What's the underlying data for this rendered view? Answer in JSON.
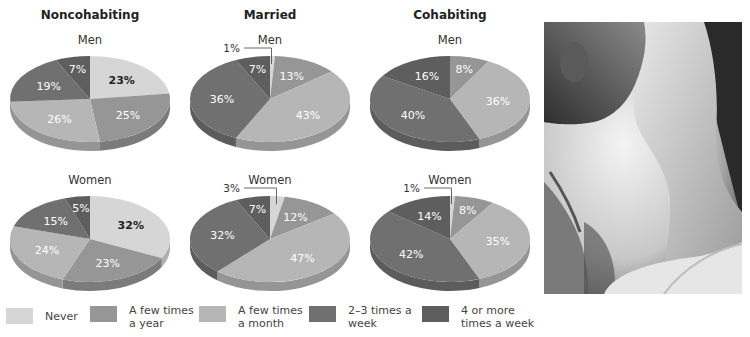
{
  "chart_data": {
    "type": "pie",
    "categories": [
      "Never",
      "A few times a year",
      "A few times a month",
      "2–3 times a week",
      "4 or more times a week"
    ],
    "colors": [
      "#d6d6d6",
      "#969696",
      "#b6b6b6",
      "#707070",
      "#5e5e5e"
    ],
    "groups": [
      {
        "title": "Noncohabiting",
        "charts": [
          {
            "subtitle": "Men",
            "values": [
              23,
              25,
              26,
              19,
              7
            ],
            "labels": [
              "23%",
              "25%",
              "26%",
              "19%",
              "7%"
            ]
          },
          {
            "subtitle": "Women",
            "values": [
              32,
              23,
              24,
              15,
              5
            ],
            "labels": [
              "32%",
              "23%",
              "24%",
              "15%",
              "5%"
            ]
          }
        ]
      },
      {
        "title": "Married",
        "charts": [
          {
            "subtitle": "Men",
            "values": [
              1,
              13,
              43,
              36,
              7
            ],
            "labels": [
              "1%",
              "13%",
              "43%",
              "36%",
              "7%"
            ]
          },
          {
            "subtitle": "Women",
            "values": [
              3,
              12,
              47,
              32,
              7
            ],
            "labels": [
              "3%",
              "12%",
              "47%",
              "32%",
              "7%"
            ]
          }
        ]
      },
      {
        "title": "Cohabiting",
        "charts": [
          {
            "subtitle": "Men",
            "values": [
              0,
              8,
              36,
              40,
              16
            ],
            "labels": [
              "",
              "8%",
              "36%",
              "40%",
              "16%"
            ]
          },
          {
            "subtitle": "Women",
            "values": [
              1,
              8,
              35,
              42,
              14
            ],
            "labels": [
              "1%",
              "8%",
              "35%",
              "42%",
              "14%"
            ]
          }
        ]
      }
    ],
    "legend": [
      {
        "label": "Never",
        "color": "#d6d6d6"
      },
      {
        "label": "A few times\na year",
        "color": "#969696"
      },
      {
        "label": "A few times\na month",
        "color": "#b6b6b6"
      },
      {
        "label": "2–3 times  a\nweek",
        "color": "#707070"
      },
      {
        "label": "4 or more\ntimes a week",
        "color": "#5e5e5e"
      }
    ],
    "legend_position": "bottom",
    "grid": false
  },
  "titles": {
    "noncohabiting": "Noncohabiting",
    "married": "Married",
    "cohabiting": "Cohabiting"
  },
  "subtitles": {
    "men": "Men",
    "women": "Women"
  },
  "legend": {
    "never": "Never",
    "year": "A few times\na year",
    "month": "A few times\na month",
    "week23": "2–3 times  a\nweek",
    "week4": "4 or more\ntimes a week"
  },
  "photo": {
    "description": "black-and-white photo of a couple about to kiss"
  }
}
